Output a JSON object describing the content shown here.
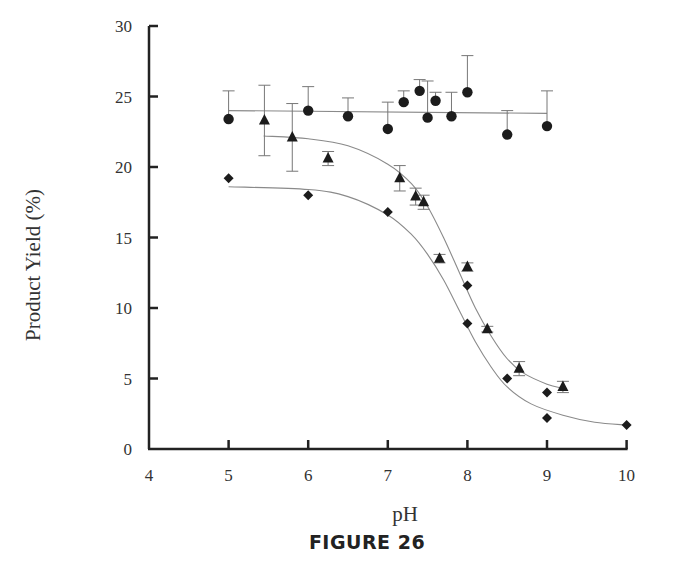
{
  "figure": {
    "caption": "FIGURE 26"
  },
  "chart_data": {
    "type": "scatter",
    "title": "",
    "xlabel": "pH",
    "ylabel": "Product Yield (%)",
    "xlim": [
      4,
      10
    ],
    "ylim": [
      0,
      30
    ],
    "xticks": [
      4,
      5,
      6,
      7,
      8,
      9,
      10
    ],
    "yticks": [
      0,
      5,
      10,
      15,
      20,
      25,
      30
    ],
    "grid": false,
    "legend": null,
    "series": [
      {
        "name": "circles",
        "marker": "circle",
        "fit": "horizontal line",
        "fit_curve": [
          [
            5.0,
            24.0
          ],
          [
            9.0,
            23.8
          ]
        ],
        "points": [
          {
            "x": 5.0,
            "y": 23.4,
            "err_up": 2.0
          },
          {
            "x": 6.0,
            "y": 24.0,
            "err_up": 1.7
          },
          {
            "x": 6.5,
            "y": 23.6,
            "err_up": 1.3
          },
          {
            "x": 7.0,
            "y": 22.7,
            "err_up": 1.9
          },
          {
            "x": 7.2,
            "y": 24.6,
            "err_up": 0.8
          },
          {
            "x": 7.4,
            "y": 25.4,
            "err_up": 0.8
          },
          {
            "x": 7.5,
            "y": 23.5,
            "err_up": 2.6
          },
          {
            "x": 7.6,
            "y": 24.7,
            "err_up": 0.6
          },
          {
            "x": 7.8,
            "y": 23.6,
            "err_up": 1.7
          },
          {
            "x": 8.0,
            "y": 25.3,
            "err_up": 2.6
          },
          {
            "x": 8.5,
            "y": 22.3,
            "err_up": 1.7
          },
          {
            "x": 9.0,
            "y": 22.9,
            "err_up": 2.5
          }
        ]
      },
      {
        "name": "triangles",
        "marker": "triangle",
        "fit": "sigmoid",
        "fit_curve": [
          [
            5.44,
            22.2
          ],
          [
            6.0,
            22.0
          ],
          [
            6.5,
            21.5
          ],
          [
            7.0,
            20.2
          ],
          [
            7.3,
            18.8
          ],
          [
            7.5,
            17.2
          ],
          [
            7.7,
            15.0
          ],
          [
            7.9,
            12.5
          ],
          [
            8.1,
            10.0
          ],
          [
            8.3,
            8.0
          ],
          [
            8.5,
            6.4
          ],
          [
            8.7,
            5.4
          ],
          [
            9.0,
            4.6
          ],
          [
            9.2,
            4.3
          ]
        ],
        "points": [
          {
            "x": 5.45,
            "y": 23.3,
            "err": 2.5
          },
          {
            "x": 5.8,
            "y": 22.1,
            "err": 2.4
          },
          {
            "x": 6.25,
            "y": 20.6,
            "err": 0.5
          },
          {
            "x": 7.15,
            "y": 19.2,
            "err": 0.9
          },
          {
            "x": 7.35,
            "y": 17.9,
            "err": 0.6
          },
          {
            "x": 7.45,
            "y": 17.5,
            "err": 0.5
          },
          {
            "x": 7.65,
            "y": 13.5,
            "err": 0.3
          },
          {
            "x": 8.0,
            "y": 12.9,
            "err": 0.3
          },
          {
            "x": 8.25,
            "y": 8.5,
            "err": 0.2
          },
          {
            "x": 8.65,
            "y": 5.7,
            "err": 0.5
          },
          {
            "x": 9.2,
            "y": 4.4,
            "err": 0.4
          }
        ]
      },
      {
        "name": "diamonds",
        "marker": "diamond",
        "fit": "sigmoid",
        "fit_curve": [
          [
            5.0,
            18.6
          ],
          [
            6.0,
            18.4
          ],
          [
            6.5,
            17.9
          ],
          [
            7.0,
            16.6
          ],
          [
            7.3,
            15.2
          ],
          [
            7.5,
            13.8
          ],
          [
            7.7,
            12.0
          ],
          [
            7.9,
            9.8
          ],
          [
            8.1,
            7.6
          ],
          [
            8.3,
            5.8
          ],
          [
            8.5,
            4.4
          ],
          [
            8.8,
            3.2
          ],
          [
            9.2,
            2.4
          ],
          [
            9.6,
            1.9
          ],
          [
            10.0,
            1.7
          ]
        ],
        "points": [
          {
            "x": 5.0,
            "y": 19.2
          },
          {
            "x": 6.0,
            "y": 18.0
          },
          {
            "x": 7.0,
            "y": 16.8
          },
          {
            "x": 8.0,
            "y": 11.6
          },
          {
            "x": 8.0,
            "y": 8.9
          },
          {
            "x": 8.5,
            "y": 5.0
          },
          {
            "x": 9.0,
            "y": 4.0
          },
          {
            "x": 9.0,
            "y": 2.2
          },
          {
            "x": 10.0,
            "y": 1.7
          }
        ]
      }
    ]
  }
}
